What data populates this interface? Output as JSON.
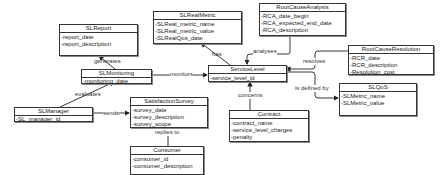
{
  "diagram": {
    "type": "uml-class-diagram",
    "classes": [
      {
        "name": "SLReport",
        "attributes": [
          "-report_date",
          "-report_description"
        ]
      },
      {
        "name": "SLMonitoring",
        "attributes": [
          "-monitoring_date"
        ]
      },
      {
        "name": "SLManager",
        "attributes": [
          "-SL_manager_id"
        ]
      },
      {
        "name": "SatisfactionSurvey",
        "attributes": [
          "-survey_date",
          "-survey_description",
          "-survey_scope"
        ]
      },
      {
        "name": "Consumer",
        "attributes": [
          "-consumer_id",
          "-consumer_description"
        ]
      },
      {
        "name": "SLRealMetric",
        "attributes": [
          "-SLReal_metric_name",
          "-SLReal_metric_value",
          "-SLRealQos_date"
        ]
      },
      {
        "name": "ServiceLevel",
        "attributes": [
          "-service_level_id"
        ]
      },
      {
        "name": "RootCauseAnalysis",
        "attributes": [
          "-RCA_date_begin",
          "-RCA_expected_end_date",
          "-RCA_description"
        ]
      },
      {
        "name": "RootCauseResolution",
        "attributes": [
          "-RCR_date",
          "-RCR_description",
          "-Resolution_cost"
        ]
      },
      {
        "name": "SLQoS",
        "attributes": [
          "-SLMetric_name",
          "-SLMetric_value"
        ]
      },
      {
        "name": "Contract",
        "attributes": [
          "-contract_name",
          "-service_level_charges",
          "-penalty"
        ]
      }
    ],
    "relations": [
      {
        "label": "generates",
        "from": "SLMonitoring",
        "to": "SLReport"
      },
      {
        "label": "evaluates",
        "from": "SLManager",
        "to": "SLMonitoring"
      },
      {
        "label": "monitors",
        "from": "SLMonitoring",
        "to": "ServiceLevel"
      },
      {
        "label": "sends",
        "from": "SLManager",
        "to": "SatisfactionSurvey"
      },
      {
        "label": "replies to",
        "from": "Consumer",
        "to": "SatisfactionSurvey"
      },
      {
        "label": "has",
        "from": "ServiceLevel",
        "to": "SLRealMetric"
      },
      {
        "label": "analyses",
        "from": "RootCauseAnalysis",
        "to": "ServiceLevel"
      },
      {
        "label": "resolves",
        "from": "RootCauseResolution",
        "to": "ServiceLevel"
      },
      {
        "label": "is defined by",
        "from": "ServiceLevel",
        "to": "SLQoS"
      },
      {
        "label": "concerns",
        "from": "Contract",
        "to": "ServiceLevel"
      }
    ]
  }
}
